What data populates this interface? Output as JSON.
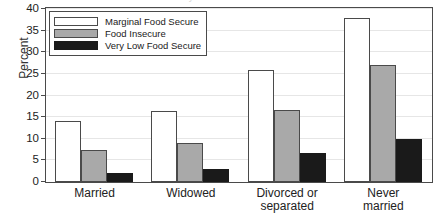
{
  "chart_data": {
    "type": "bar",
    "title": "",
    "xlabel": "",
    "ylabel": "Percent",
    "ylim": [
      0,
      40
    ],
    "yticks": [
      0,
      5,
      10,
      15,
      20,
      25,
      30,
      35,
      40
    ],
    "grid": true,
    "legend_position": "upper-left-inside",
    "categories": [
      "Married",
      "Widowed",
      "Divorced or separated",
      "Never married"
    ],
    "category_lines": [
      [
        "Married"
      ],
      [
        "Widowed"
      ],
      [
        "Divorced or",
        "separated"
      ],
      [
        "Never",
        "married"
      ]
    ],
    "series": [
      {
        "name": "Marginal Food Secure",
        "color": "#ffffff",
        "values": [
          14.0,
          16.5,
          26.0,
          38.0
        ]
      },
      {
        "name": "Food Insecure",
        "color": "#a9a9a9",
        "values": [
          7.4,
          9.0,
          16.7,
          27.0
        ]
      },
      {
        "name": "Very Low Food Secure",
        "color": "#1a1a1a",
        "values": [
          2.0,
          3.0,
          6.8,
          10.0
        ]
      }
    ]
  },
  "legend": {
    "items": [
      {
        "label": "Marginal Food Secure"
      },
      {
        "label": "Food Insecure"
      },
      {
        "label": "Very Low Food Secure"
      }
    ]
  },
  "axis": {
    "y_title": "Percent"
  },
  "title_sliver": {
    "text": "by marital status"
  }
}
